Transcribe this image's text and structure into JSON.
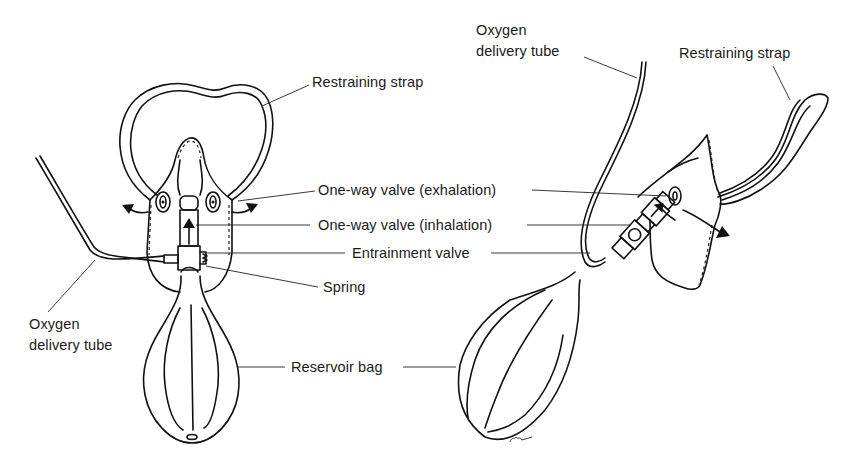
{
  "figure": {
    "views": [
      "front-view",
      "side-view"
    ],
    "colors": {
      "ink": "#111111",
      "background": "#ffffff"
    }
  },
  "front_view": {
    "labels": {
      "restraining_strap": "Restraining strap",
      "one_way_valve_exhalation": "One-way valve (exhalation)",
      "one_way_valve_inhalation": "One-way valve (inhalation)",
      "entrainment_valve": "Entrainment valve",
      "spring": "Spring",
      "oxygen_delivery_tube_line1": "Oxygen",
      "oxygen_delivery_tube_line2": "delivery tube",
      "reservoir_bag": "Reservoir bag"
    }
  },
  "side_view": {
    "labels": {
      "oxygen_delivery_tube_line1": "Oxygen",
      "oxygen_delivery_tube_line2": "delivery tube",
      "restraining_strap": "Restraining strap"
    },
    "signature": "CKS"
  }
}
